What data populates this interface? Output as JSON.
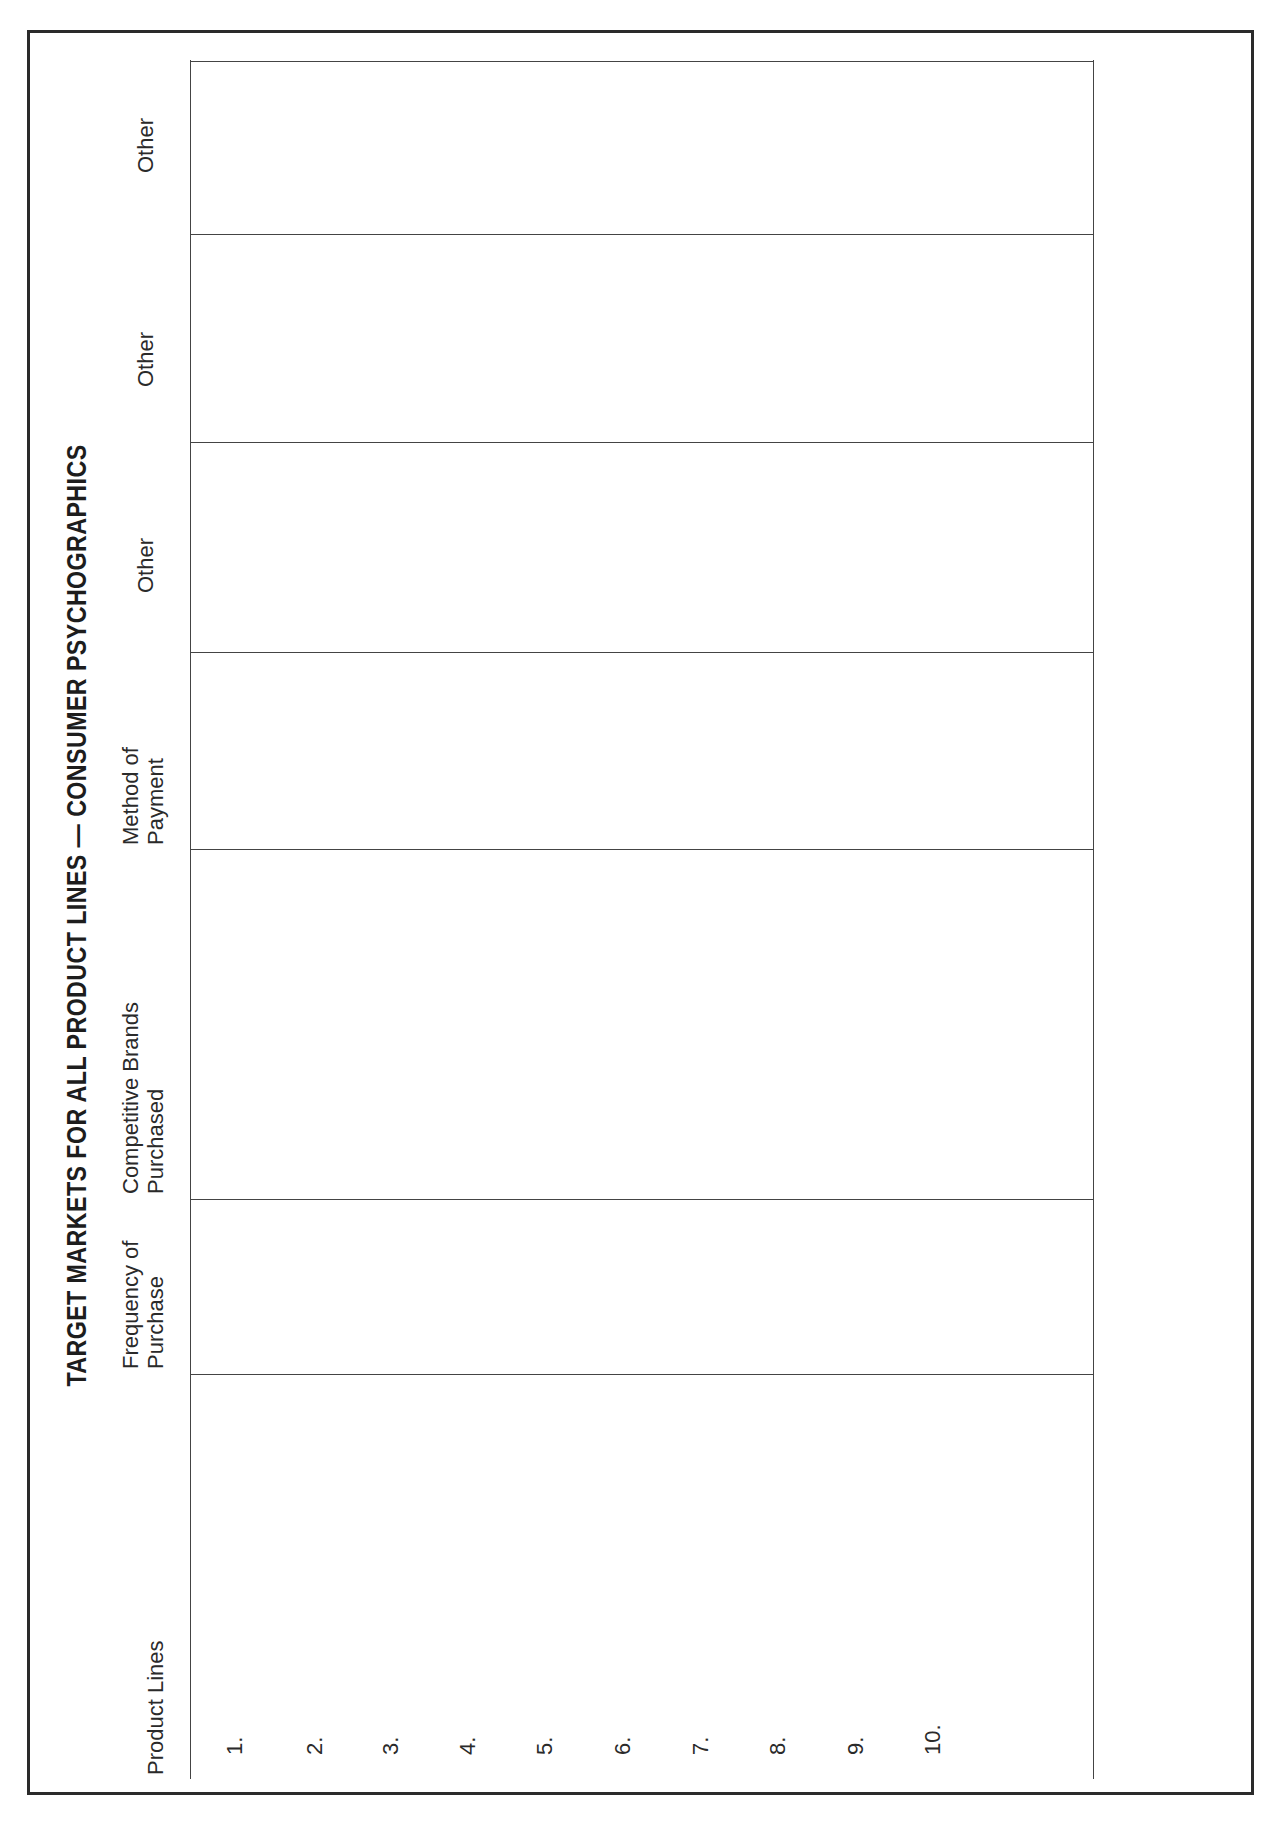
{
  "page": {
    "title": "TARGET MARKETS FOR ALL PRODUCT LINES — CONSUMER PSYCHOGRAPHICS",
    "orientation": "rotated-90-ccw",
    "columns": [
      {
        "line1": "Product Lines",
        "line2": ""
      },
      {
        "line1": "Frequency of",
        "line2": "Purchase"
      },
      {
        "line1": "Competitive Brands",
        "line2": "Purchased"
      },
      {
        "line1": "Method of",
        "line2": "Payment"
      },
      {
        "line1": "Other",
        "line2": ""
      },
      {
        "line1": "Other",
        "line2": ""
      },
      {
        "line1": "Other",
        "line2": ""
      }
    ],
    "rows": [
      "1.",
      "2.",
      "3.",
      "4.",
      "5.",
      "6.",
      "7.",
      "8.",
      "9.",
      "10."
    ],
    "line_color": "#444444",
    "border_color": "#2a2a2a"
  }
}
